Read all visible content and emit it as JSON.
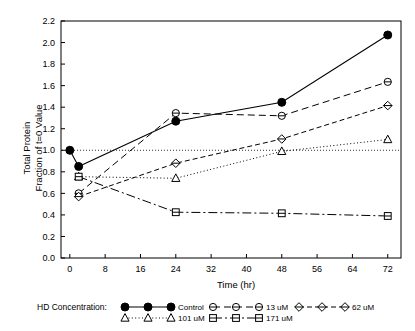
{
  "chart_data": {
    "type": "line",
    "title": "",
    "xlabel": "Time  (hr)",
    "ylabel": "Total Protein\nFraction of t=0 Value",
    "ylabel_line1": "Total Protein",
    "ylabel_line2": "Fraction of t=0 Value",
    "xlim": [
      -2,
      75
    ],
    "ylim": [
      0.0,
      2.2
    ],
    "xticks": [
      0,
      8,
      16,
      24,
      32,
      40,
      48,
      56,
      64,
      72
    ],
    "xticklabels": [
      "0",
      "8",
      "16",
      "24",
      "32",
      "40",
      "48",
      "56",
      "64",
      "72"
    ],
    "yticks": [
      0.0,
      0.2,
      0.4,
      0.6,
      0.8,
      1.0,
      1.2,
      1.4,
      1.6,
      1.8,
      2.0,
      2.2
    ],
    "yticklabels": [
      "0.0",
      "0.2",
      "0.4",
      "0.6",
      "0.8",
      "1.0",
      "1.2",
      "1.4",
      "1.6",
      "1.8",
      "2.0",
      "2.2"
    ],
    "grid": false,
    "reference_line": {
      "y": 1.0,
      "style": "dotted"
    },
    "legend_position": "below",
    "legend_title": "HD Concentration:",
    "series": [
      {
        "name": "Control",
        "marker": "filled-circle",
        "linestyle": "solid",
        "x": [
          0,
          2,
          24,
          48,
          72
        ],
        "y": [
          1.0,
          0.85,
          1.27,
          1.445,
          2.07
        ]
      },
      {
        "name": "13 uM",
        "marker": "open-circle",
        "linestyle": "dashed",
        "x": [
          2,
          24,
          48,
          72
        ],
        "y": [
          0.6,
          1.345,
          1.32,
          1.635
        ]
      },
      {
        "name": "62 uM",
        "marker": "open-diamond",
        "linestyle": "dash-dot",
        "x": [
          2,
          24,
          48,
          72
        ],
        "y": [
          0.57,
          0.88,
          1.105,
          1.415
        ]
      },
      {
        "name": "101 uM",
        "marker": "open-triangle",
        "linestyle": "dotted",
        "x": [
          2,
          24,
          48,
          72
        ],
        "y": [
          0.755,
          0.74,
          0.99,
          1.1
        ]
      },
      {
        "name": "171 uM",
        "marker": "open-square",
        "linestyle": "long-dash-dot",
        "x": [
          2,
          24,
          48,
          72
        ],
        "y": [
          0.755,
          0.425,
          0.415,
          0.39
        ]
      }
    ]
  },
  "legend": {
    "title": "HD Concentration:",
    "entries": [
      {
        "label": "Control",
        "marker": "filled-circle",
        "linestyle": "solid"
      },
      {
        "label": "13 uM",
        "marker": "open-circle",
        "linestyle": "dashed"
      },
      {
        "label": "62 uM",
        "marker": "open-diamond",
        "linestyle": "dash-dot"
      },
      {
        "label": "101 uM",
        "marker": "open-triangle",
        "linestyle": "dotted"
      },
      {
        "label": "171 uM",
        "marker": "open-square",
        "linestyle": "long-dash-dot"
      }
    ]
  },
  "colors": {
    "ink": "#000000",
    "background": "#ffffff"
  }
}
